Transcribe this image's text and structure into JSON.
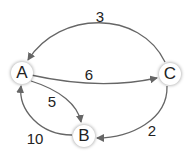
{
  "nodes": [
    {
      "id": "A",
      "label": "A"
    },
    {
      "id": "B",
      "label": "B"
    },
    {
      "id": "C",
      "label": "C"
    }
  ],
  "edges": [
    {
      "from": "C",
      "to": "A",
      "weight": "3"
    },
    {
      "from": "A",
      "to": "C",
      "weight": "6"
    },
    {
      "from": "A",
      "to": "B",
      "weight": "5"
    },
    {
      "from": "B",
      "to": "A",
      "weight": "10"
    },
    {
      "from": "C",
      "to": "B",
      "weight": "2"
    }
  ],
  "colors": {
    "edge": "#666666",
    "node_fill": "#ffffff",
    "text": "#222222"
  }
}
